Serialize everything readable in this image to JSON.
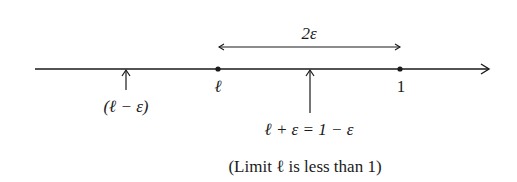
{
  "diagram": {
    "title_label": "2ε",
    "points": {
      "l_minus_eps": "(ℓ − ε)",
      "l": "ℓ",
      "one": "1",
      "l_plus_eps": "ℓ + ε = 1 − ε"
    },
    "caption": "(Limit ℓ is less than 1)",
    "colors": {
      "line": "#1a1a1a",
      "background": "#ffffff"
    }
  }
}
